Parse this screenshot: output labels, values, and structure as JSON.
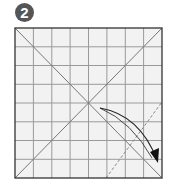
{
  "step": {
    "number": "2"
  },
  "diagram": {
    "grid_divisions": 8,
    "colors": {
      "paper": "#f2f2f2",
      "grid": "#9a9a9a",
      "border": "#333333",
      "badge": "#555555",
      "arrow": "#222222",
      "dashed": "#888888"
    }
  }
}
